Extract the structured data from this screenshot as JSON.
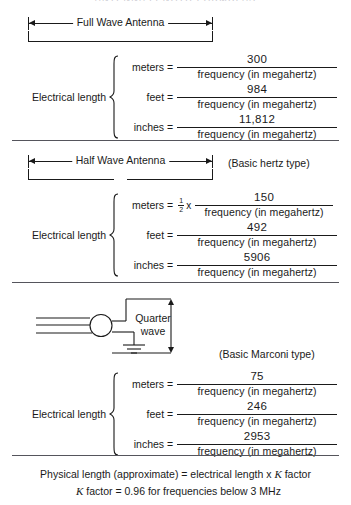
{
  "top_title": "ANTENNA LENGTH FORMULAS",
  "denominator": "frequency (in megahertz)",
  "sections": [
    {
      "bracket_label": "Full Wave Antenna",
      "type_note": "",
      "group_label": "Electrical length",
      "rows": [
        {
          "unit": "meters =",
          "factor": "",
          "numerator": "300"
        },
        {
          "unit": "feet =",
          "factor": "",
          "numerator": "984"
        },
        {
          "unit": "inches =",
          "factor": "",
          "numerator": "11,812"
        }
      ]
    },
    {
      "bracket_label": "Half Wave Antenna",
      "type_note": "(Basic hertz type)",
      "group_label": "Electrical length",
      "rows": [
        {
          "unit": "meters =",
          "factor": "half",
          "numerator": "150"
        },
        {
          "unit": "feet =",
          "factor": "",
          "numerator": "492"
        },
        {
          "unit": "inches =",
          "factor": "",
          "numerator": "5906"
        }
      ]
    },
    {
      "bracket_label": "",
      "type_note": "(Basic Marconi type)",
      "group_label": "Electrical length",
      "rows": [
        {
          "unit": "meters =",
          "factor": "",
          "numerator": "75"
        },
        {
          "unit": "feet =",
          "factor": "",
          "numerator": "246"
        },
        {
          "unit": "inches =",
          "factor": "",
          "numerator": "2953"
        }
      ]
    }
  ],
  "figure": {
    "dimension_label_line1": "Quarter",
    "dimension_label_line2": "wave"
  },
  "footer": {
    "line1_a": "Physical length (approximate) = electrical length x ",
    "line1_k": "K",
    "line1_b": " factor",
    "line2_k": "K",
    "line2_b": " factor = 0.96 for frequencies below 3 MHz"
  },
  "fraction_half": {
    "numerator": "1",
    "denominator": "2",
    "times": "x"
  },
  "colors": {
    "ink": "#1a1a1a",
    "rule": "#55555c",
    "background": "#ffffff"
  }
}
